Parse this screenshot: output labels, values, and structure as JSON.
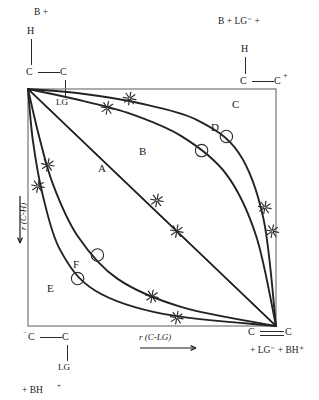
{
  "diagram": {
    "type": "reaction coordinate grid",
    "axes": {
      "x_label": "r (C-LG)",
      "x_arrow": "right",
      "y_label": "r (C-H)",
      "y_arrow": "down"
    },
    "corners": {
      "top_left": {
        "reagent": "B +",
        "atoms": {
          "h": "H",
          "c_left": "C",
          "c_right": "C",
          "lg": "LG"
        },
        "description": "H-C-C-LG plus base B"
      },
      "top_right": {
        "reagent": "B + LG⁻ +",
        "atoms": {
          "h": "H",
          "c_left": "C",
          "c_right": "C",
          "charge": "+"
        },
        "description": "carbocation H-C-C+ with B and LG-"
      },
      "bottom_left": {
        "atoms": {
          "c_left": "C",
          "c_left_charge": "⁻",
          "c_right": "C",
          "lg": "LG"
        },
        "reagent": "+ BH",
        "reagent_charge": "+",
        "description": "carbanion -C-C-LG plus BH+"
      },
      "bottom_right": {
        "atoms": {
          "c_left": "C",
          "c_right": "C"
        },
        "bond": "double",
        "reagent": "+ LG⁻ + BH⁺",
        "description": "alkene C=C plus LG- and BH+"
      }
    },
    "curve_labels": [
      {
        "id": "A",
        "label": "A",
        "x": 98,
        "y": 163
      },
      {
        "id": "B",
        "label": "B",
        "x": 139,
        "y": 146
      },
      {
        "id": "C",
        "label": "C",
        "x": 232,
        "y": 99
      },
      {
        "id": "D",
        "label": "D",
        "x": 211,
        "y": 122
      },
      {
        "id": "E",
        "label": "E",
        "x": 47,
        "y": 283
      },
      {
        "id": "F",
        "label": "F",
        "x": 73,
        "y": 259
      }
    ],
    "colors": {
      "ink": "#1a1a1a",
      "curve": "#232323",
      "frame": "#8a8a8a",
      "marker": "#2b2b2b"
    }
  },
  "chart_data": {
    "type": "line",
    "xlabel": "r (C-LG)",
    "ylabel": "r (C-H)",
    "xlim": [
      0,
      1
    ],
    "ylim": [
      0,
      1
    ],
    "grid": false,
    "legend": "inline curve labels A-F",
    "note": "All six reaction paths run from the top-left corner (reactant) to the bottom-right corner (product). y axis increases downward.",
    "plot_box": {
      "left": 28,
      "top": 89,
      "right": 276,
      "bottom": 326
    },
    "series": [
      {
        "name": "A",
        "label": "A",
        "description": "straight diagonal, concerted E2 path (lower of the two diagonals)",
        "points": [
          [
            0,
            0
          ],
          [
            0.25,
            0.25
          ],
          [
            0.5,
            0.5
          ],
          [
            0.75,
            0.75
          ],
          [
            1,
            1
          ]
        ],
        "markers": [
          {
            "type": "star",
            "x": 0.6,
            "y": 0.6
          }
        ]
      },
      {
        "name": "B",
        "label": "B",
        "description": "straight diagonal, concerted E2 path (upper of the two diagonals)",
        "points": [
          [
            0,
            0
          ],
          [
            0.25,
            0.25
          ],
          [
            0.5,
            0.5
          ],
          [
            0.75,
            0.75
          ],
          [
            1,
            1
          ]
        ],
        "markers": [
          {
            "type": "star",
            "x": 0.52,
            "y": 0.47
          }
        ]
      },
      {
        "name": "C",
        "label": "C",
        "description": "strongly E1-like path bowing toward the carbocation (top-right) corner",
        "points": [
          [
            0,
            0
          ],
          [
            0.22,
            0.02
          ],
          [
            0.45,
            0.06
          ],
          [
            0.68,
            0.13
          ],
          [
            0.85,
            0.27
          ],
          [
            0.95,
            0.55
          ],
          [
            1,
            1
          ]
        ],
        "markers": [
          {
            "type": "star",
            "x": 0.41,
            "y": 0.04
          },
          {
            "type": "star",
            "x": 0.985,
            "y": 0.6
          },
          {
            "type": "circle",
            "x": 0.8,
            "y": 0.2
          }
        ]
      },
      {
        "name": "D",
        "label": "D",
        "description": "moderately E1-like path bowing toward the carbocation corner",
        "points": [
          [
            0,
            0
          ],
          [
            0.18,
            0.04
          ],
          [
            0.4,
            0.1
          ],
          [
            0.62,
            0.2
          ],
          [
            0.8,
            0.36
          ],
          [
            0.92,
            0.62
          ],
          [
            1,
            1
          ]
        ],
        "markers": [
          {
            "type": "star",
            "x": 0.32,
            "y": 0.08
          },
          {
            "type": "star",
            "x": 0.955,
            "y": 0.5
          },
          {
            "type": "circle",
            "x": 0.7,
            "y": 0.26
          }
        ]
      },
      {
        "name": "E",
        "label": "E",
        "description": "strongly E1cb-like path bowing toward the carbanion (bottom-left) corner",
        "points": [
          [
            0,
            0
          ],
          [
            0.02,
            0.22
          ],
          [
            0.06,
            0.45
          ],
          [
            0.13,
            0.68
          ],
          [
            0.27,
            0.85
          ],
          [
            0.55,
            0.95
          ],
          [
            1,
            1
          ]
        ],
        "markers": [
          {
            "type": "star",
            "x": 0.04,
            "y": 0.41
          },
          {
            "type": "star",
            "x": 0.6,
            "y": 0.965
          },
          {
            "type": "circle",
            "x": 0.2,
            "y": 0.8
          }
        ]
      },
      {
        "name": "F",
        "label": "F",
        "description": "moderately E1cb-like path bowing toward the carbanion corner",
        "points": [
          [
            0,
            0
          ],
          [
            0.04,
            0.18
          ],
          [
            0.1,
            0.4
          ],
          [
            0.2,
            0.62
          ],
          [
            0.36,
            0.8
          ],
          [
            0.62,
            0.92
          ],
          [
            1,
            1
          ]
        ],
        "markers": [
          {
            "type": "star",
            "x": 0.08,
            "y": 0.32
          },
          {
            "type": "star",
            "x": 0.5,
            "y": 0.875
          },
          {
            "type": "circle",
            "x": 0.28,
            "y": 0.7
          }
        ]
      }
    ]
  }
}
